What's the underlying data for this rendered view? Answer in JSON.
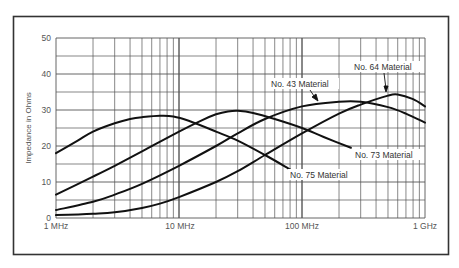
{
  "chart_data": {
    "type": "line",
    "title": "",
    "xlabel": "",
    "ylabel": "Impedance in Ohms",
    "x_scale": "log",
    "x_unit": "MHz",
    "xlim": [
      1,
      1000
    ],
    "ylim": [
      0,
      50
    ],
    "grid": true,
    "x_ticks": [
      {
        "value": 1,
        "label": "1 MHz"
      },
      {
        "value": 10,
        "label": "10 MHz"
      },
      {
        "value": 100,
        "label": "100 MHz"
      },
      {
        "value": 1000,
        "label": "1 GHz"
      }
    ],
    "y_ticks": [
      0,
      10,
      20,
      30,
      40,
      50
    ],
    "series": [
      {
        "name": "No. 75 Material",
        "x": [
          1,
          1.5,
          2,
          3,
          4,
          5,
          7,
          9,
          12,
          20,
          30,
          50,
          80
        ],
        "values": [
          18,
          21.5,
          24,
          26.3,
          27.5,
          28,
          28.4,
          28.2,
          27,
          24,
          21.5,
          17.5,
          13.5
        ]
      },
      {
        "name": "No. 73 Material",
        "x": [
          1,
          2,
          3,
          5,
          10,
          15,
          20,
          25,
          30,
          40,
          60,
          100,
          150,
          250
        ],
        "values": [
          6.5,
          11.5,
          14.5,
          18.5,
          24,
          27,
          28.8,
          29.6,
          29.8,
          29.2,
          27.5,
          25,
          22.5,
          19.5
        ]
      },
      {
        "name": "No. 43 Material",
        "x": [
          1,
          2,
          3,
          5,
          10,
          20,
          30,
          50,
          100,
          200,
          300,
          500,
          700,
          1000
        ],
        "values": [
          2.2,
          4.5,
          6.5,
          9.5,
          14.5,
          20,
          23.5,
          27.5,
          31,
          32.3,
          32.3,
          30.8,
          29,
          26.5
        ]
      },
      {
        "name": "No. 64 Material",
        "x": [
          1,
          2,
          3,
          5,
          7,
          10,
          20,
          30,
          50,
          100,
          200,
          300,
          500,
          600,
          800,
          1000
        ],
        "values": [
          0.8,
          1.2,
          1.6,
          2.8,
          4,
          5.8,
          10,
          13,
          17.5,
          23.5,
          29,
          31.5,
          34,
          34.3,
          33,
          31
        ]
      }
    ],
    "annotations": [
      {
        "text": "No. 64 Material",
        "points_to": "No. 64 Material"
      },
      {
        "text": "No. 43 Material",
        "points_to": "No. 43 Material"
      },
      {
        "text": "No. 73 Material",
        "points_to": "No. 73 Material"
      },
      {
        "text": "No. 75 Material",
        "points_to": "No. 75 Material"
      }
    ],
    "legend": "none (curves labeled directly)"
  },
  "labels": {
    "ylabel": "Impedance in Ohms",
    "x_ticks": [
      "1 MHz",
      "10 MHz",
      "100 MHz",
      "1 GHz"
    ],
    "y_ticks": [
      "0",
      "10",
      "20",
      "30",
      "40",
      "50"
    ],
    "curve_labels": {
      "m64": "No. 64 Material",
      "m43": "No. 43 Material",
      "m73": "No. 73 Material",
      "m75": "No. 75 Material"
    }
  },
  "style": {
    "curve_color": "#111111",
    "grid_color": "#555555",
    "frame_color": "#333333"
  }
}
